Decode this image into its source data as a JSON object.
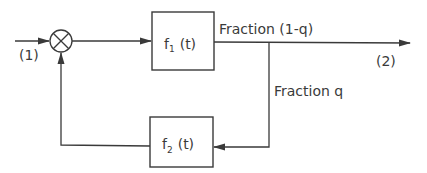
{
  "diagram": {
    "type": "block-diagram-feedback-loop",
    "nodes": {
      "summing_junction": {
        "symbol": "⊗"
      },
      "block1": {
        "label_main": "f",
        "label_sub": "1",
        "label_arg": "(t)"
      },
      "block2": {
        "label_main": "f",
        "label_sub": "2",
        "label_arg": "(t)"
      }
    },
    "labels": {
      "input": "(1)",
      "output": "(2)",
      "forward_fraction": "Fraction (1-q)",
      "feedback_fraction": "Fraction q"
    },
    "edges": [
      {
        "from": "input",
        "to": "summing_junction"
      },
      {
        "from": "summing_junction",
        "to": "block1"
      },
      {
        "from": "block1",
        "to": "output",
        "label": "Fraction (1-q)"
      },
      {
        "from": "block1",
        "to": "block2",
        "label": "Fraction q"
      },
      {
        "from": "block2",
        "to": "summing_junction"
      }
    ],
    "colors": {
      "ink": "#3a3a3a",
      "background": "#ffffff"
    }
  }
}
